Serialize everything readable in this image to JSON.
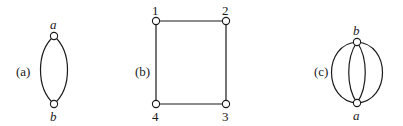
{
  "figures": [
    {
      "id": "a",
      "caption": "(a)",
      "nodes": [
        {
          "id": "a",
          "label": "a"
        },
        {
          "id": "b",
          "label": "b"
        }
      ],
      "edges": [
        [
          "a",
          "b"
        ],
        [
          "a",
          "b"
        ]
      ]
    },
    {
      "id": "b",
      "caption": "(b)",
      "nodes": [
        {
          "id": "1",
          "label": "1"
        },
        {
          "id": "2",
          "label": "2"
        },
        {
          "id": "3",
          "label": "3"
        },
        {
          "id": "4",
          "label": "4"
        }
      ],
      "edges": [
        [
          "1",
          "2"
        ],
        [
          "2",
          "3"
        ],
        [
          "3",
          "4"
        ],
        [
          "4",
          "1"
        ]
      ]
    },
    {
      "id": "c",
      "caption": "(c)",
      "nodes": [
        {
          "id": "b",
          "label": "b"
        },
        {
          "id": "a",
          "label": "a"
        }
      ],
      "edges": [
        [
          "b",
          "a"
        ],
        [
          "b",
          "a"
        ],
        [
          "b",
          "a"
        ],
        [
          "b",
          "a"
        ]
      ]
    }
  ]
}
